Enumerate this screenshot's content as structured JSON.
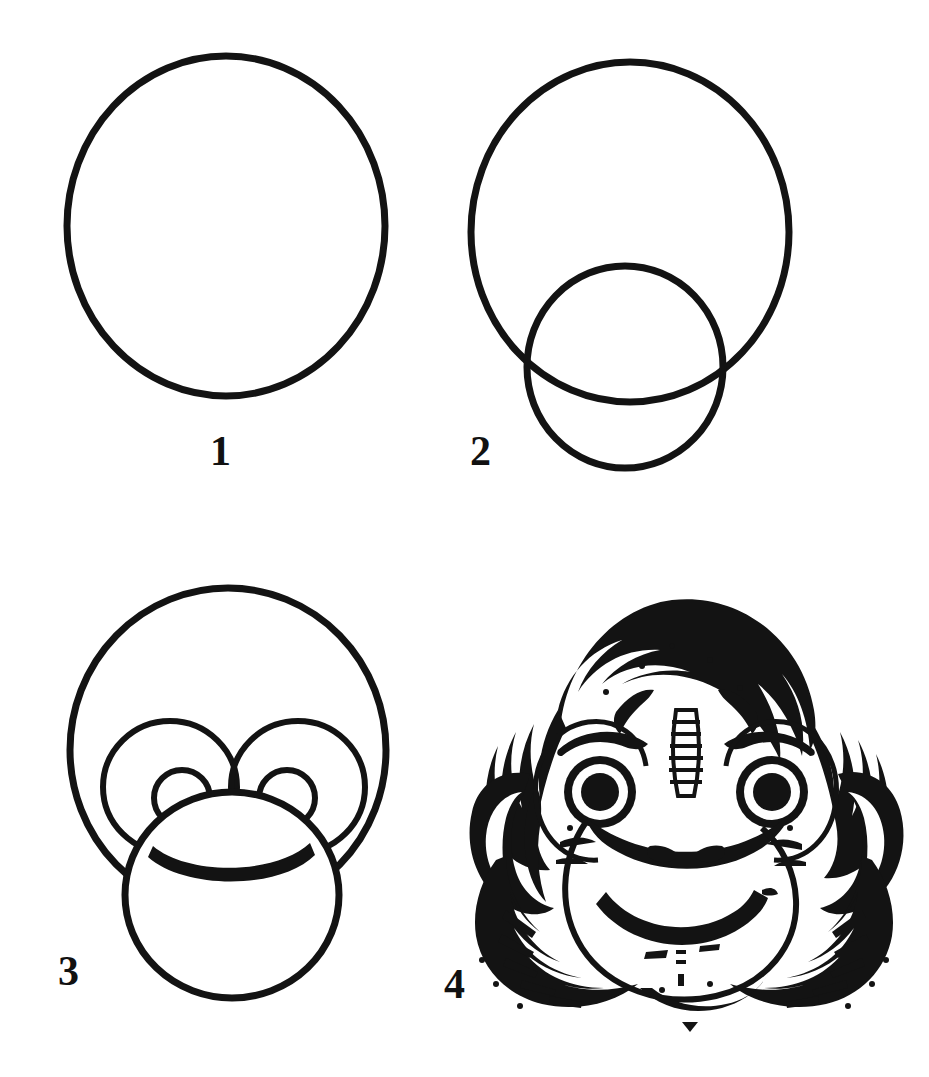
{
  "page": {
    "background_color": "#ffffff",
    "ink_color": "#131313",
    "width": 929,
    "height": 1077,
    "style": "black-and-white line-art drawing tutorial, four numbered steps"
  },
  "steps": [
    {
      "number": "1",
      "name": "head-outline",
      "description": "One large circle forming the head",
      "shapes": [
        "head circle"
      ]
    },
    {
      "number": "2",
      "name": "muzzle-outline",
      "description": "Large head circle plus a smaller overlapping circle for the muzzle",
      "shapes": [
        "head circle",
        "muzzle circle"
      ]
    },
    {
      "number": "3",
      "name": "eyes-and-mouth",
      "description": "Head circle with two eye sockets, pupils, muzzle circle and a curved smile",
      "shapes": [
        "head circle",
        "left eye socket",
        "right eye socket",
        "left pupil",
        "right pupil",
        "muzzle circle",
        "smile arc"
      ]
    },
    {
      "number": "4",
      "name": "finished-chimpanzee",
      "description": "Finished inked chimpanzee face with shaggy fur, ears, brows, filled pupils, nostrils and a broad smile",
      "shapes": [
        "fur mane",
        "ears",
        "brows",
        "eyes with filled pupils",
        "nose bridge",
        "nostrils",
        "muzzle",
        "mouth",
        "chin marks"
      ]
    }
  ],
  "labels": {
    "step_1": "1",
    "step_2": "2",
    "step_3": "3",
    "step_4": "4"
  }
}
